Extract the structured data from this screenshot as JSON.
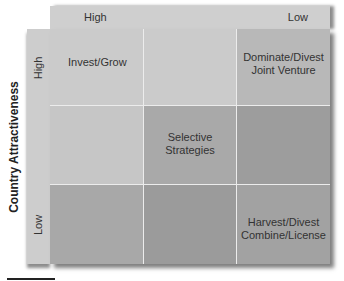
{
  "diagram": {
    "type": "strategy-matrix-3x3",
    "top_axis": {
      "labels": {
        "high": "High",
        "low": "Low"
      }
    },
    "left_axis": {
      "title": "Country Attractiveness",
      "labels": {
        "high": "High",
        "low": "Low"
      }
    },
    "cells": [
      {
        "row": 1,
        "col": 1,
        "text": "Invest/Grow",
        "color": "#cbcbcb"
      },
      {
        "row": 1,
        "col": 2,
        "text": "",
        "color": "#cbcbcb"
      },
      {
        "row": 1,
        "col": 3,
        "text": "Dominate/Divest\nJoint Venture",
        "color": "#b8b8b8"
      },
      {
        "row": 2,
        "col": 1,
        "text": "",
        "color": "#c6c6c6"
      },
      {
        "row": 2,
        "col": 2,
        "text": "Selective\nStrategies",
        "color": "#a9a9a9"
      },
      {
        "row": 2,
        "col": 3,
        "text": "",
        "color": "#9d9d9d"
      },
      {
        "row": 3,
        "col": 1,
        "text": "",
        "color": "#a8a8a8"
      },
      {
        "row": 3,
        "col": 2,
        "text": "",
        "color": "#9b9b9b"
      },
      {
        "row": 3,
        "col": 3,
        "text": "Harvest/Divest\nCombine/License",
        "color": "#a2a2a2"
      }
    ],
    "colors": {
      "header_bg": "#cfcfcf",
      "side_bg": "#cdcdcd",
      "grid_lines": "#ececec"
    }
  }
}
